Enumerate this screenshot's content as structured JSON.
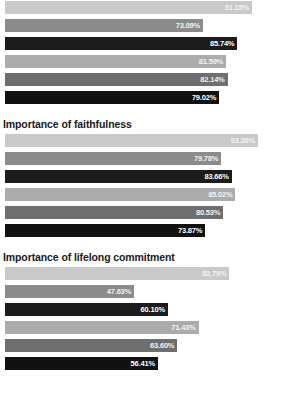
{
  "chart_data": {
    "type": "bar",
    "orientation": "horizontal",
    "title": "",
    "xlabel": "",
    "ylabel": "",
    "xlim": [
      0,
      100
    ],
    "grid": false,
    "legend": "none",
    "value_suffix": "%",
    "series_colors": [
      "#c9c9c9",
      "#8b8b8b",
      "#1c1c1c",
      "#ababab",
      "#6e6e6e",
      "#111111"
    ],
    "panels": [
      {
        "title": "",
        "categories": [
          "1",
          "2",
          "3",
          "4",
          "5",
          "6"
        ],
        "values": [
          91.15,
          73.09,
          85.74,
          81.59,
          82.14,
          79.02
        ],
        "labels": [
          "91.15%",
          "73.09%",
          "85.74%",
          "81.59%",
          "82.14%",
          "79.02%"
        ]
      },
      {
        "title": "Importance of faithfulness",
        "categories": [
          "1",
          "2",
          "3",
          "4",
          "5",
          "6"
        ],
        "values": [
          93.36,
          79.78,
          83.66,
          85.02,
          80.53,
          73.87
        ],
        "labels": [
          "93.36%",
          "79.78%",
          "83.66%",
          "85.02%",
          "80.53%",
          "73.87%"
        ]
      },
      {
        "title": "Importance of lifelong commitment",
        "categories": [
          "1",
          "2",
          "3",
          "4",
          "5",
          "6"
        ],
        "values": [
          82.79,
          47.63,
          60.1,
          71.43,
          63.6,
          56.41
        ],
        "labels": [
          "82.79%",
          "47.63%",
          "60.10%",
          "71.43%",
          "63.60%",
          "56.41%"
        ]
      }
    ]
  }
}
